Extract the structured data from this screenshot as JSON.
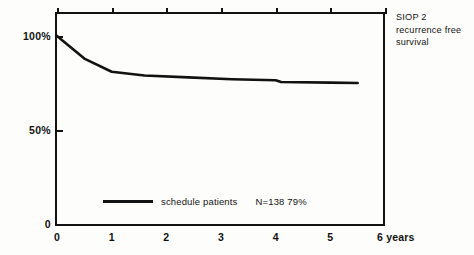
{
  "chart_data": {
    "type": "line",
    "title": "",
    "subtitle": "",
    "xlabel": "years",
    "ylabel": "",
    "xlim": [
      0,
      6
    ],
    "ylim": [
      0,
      105
    ],
    "grid": false,
    "legend_position": "inside-bottom-left",
    "x_ticks": [
      {
        "value": 0,
        "label": "0"
      },
      {
        "value": 1,
        "label": "1"
      },
      {
        "value": 2,
        "label": "2"
      },
      {
        "value": 3,
        "label": "3"
      },
      {
        "value": 4,
        "label": "4"
      },
      {
        "value": 5,
        "label": "5"
      },
      {
        "value": 6,
        "label": "6 years"
      }
    ],
    "y_ticks": [
      {
        "value": 0,
        "label": "0"
      },
      {
        "value": 50,
        "label": "50%"
      },
      {
        "value": 100,
        "label": "100%"
      }
    ],
    "series": [
      {
        "name": "schedule patients",
        "n": "N=138",
        "final_value_label": "79%",
        "x": [
          0,
          0.25,
          0.5,
          1.0,
          1.6,
          2.4,
          3.2,
          4.0,
          4.1,
          5.0,
          5.5
        ],
        "values": [
          100,
          94,
          88,
          81,
          79,
          78,
          77,
          76.5,
          75.5,
          75.2,
          75
        ]
      }
    ],
    "annotations": [
      {
        "name": "panel-label",
        "lines": [
          "SIOP 2",
          "recurrence free",
          "survival"
        ]
      }
    ]
  },
  "legend": {
    "label": "schedule patients",
    "stats": "N=138  79%"
  },
  "annotation": {
    "line1": "SIOP 2",
    "line2": "recurrence free",
    "line3": "survival"
  }
}
